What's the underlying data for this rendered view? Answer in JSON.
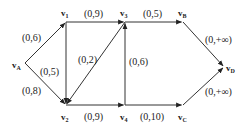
{
  "diagram": {
    "type": "flow-network",
    "nodes": [
      {
        "id": "vA",
        "base": "v",
        "sub": "A",
        "x": 25,
        "y": 63,
        "lx": 12,
        "ly": 68
      },
      {
        "id": "v1",
        "base": "v",
        "sub": "1",
        "x": 66,
        "y": 22,
        "lx": 61,
        "ly": 16
      },
      {
        "id": "v3",
        "base": "v",
        "sub": "3",
        "x": 125,
        "y": 22,
        "lx": 120,
        "ly": 16
      },
      {
        "id": "vB",
        "base": "v",
        "sub": "B",
        "x": 183,
        "y": 22,
        "lx": 178,
        "ly": 16
      },
      {
        "id": "vD",
        "base": "v",
        "sub": "D",
        "x": 224,
        "y": 67,
        "lx": 226,
        "ly": 71
      },
      {
        "id": "v2",
        "base": "v",
        "sub": "2",
        "x": 66,
        "y": 105,
        "lx": 61,
        "ly": 120
      },
      {
        "id": "v4",
        "base": "v",
        "sub": "4",
        "x": 125,
        "y": 105,
        "lx": 120,
        "ly": 120
      },
      {
        "id": "vC",
        "base": "v",
        "sub": "C",
        "x": 183,
        "y": 105,
        "lx": 178,
        "ly": 120
      }
    ],
    "edges": [
      {
        "from": "vA",
        "to": "v1",
        "label": "(0,6)",
        "lx": 22,
        "ly": 41
      },
      {
        "from": "vA",
        "to": "v2",
        "label": "(0,8)",
        "lx": 22,
        "ly": 94
      },
      {
        "from": "v1",
        "to": "v2",
        "label": "(0,5)",
        "lx": 40,
        "ly": 75
      },
      {
        "from": "v1",
        "to": "v3",
        "label": "(0,9)",
        "lx": 84,
        "ly": 17
      },
      {
        "from": "v3",
        "to": "v2",
        "label": "(0,2)",
        "lx": 78,
        "ly": 63
      },
      {
        "from": "v4",
        "to": "v3",
        "label": "(0,6)",
        "lx": 129,
        "ly": 65
      },
      {
        "from": "v2",
        "to": "v4",
        "label": "(0,9)",
        "lx": 84,
        "ly": 120
      },
      {
        "from": "v3",
        "to": "vB",
        "label": "(0,5)",
        "lx": 143,
        "ly": 17
      },
      {
        "from": "v4",
        "to": "vC",
        "label": "(0,10)",
        "lx": 140,
        "ly": 120
      },
      {
        "from": "vB",
        "to": "vD",
        "label": "(0,+∞)",
        "lx": 205,
        "ly": 43
      },
      {
        "from": "vC",
        "to": "vD",
        "label": "(0,+∞)",
        "lx": 205,
        "ly": 95
      }
    ]
  }
}
